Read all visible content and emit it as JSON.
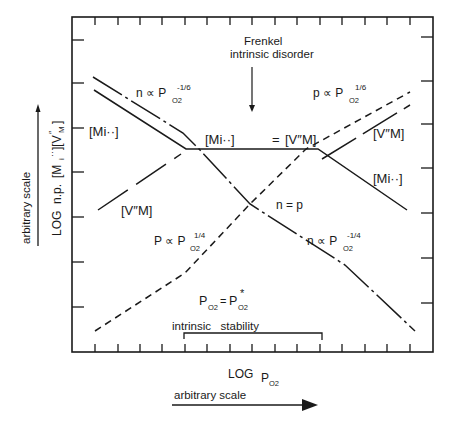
{
  "figure": {
    "type": "defect-concentration-diagram",
    "title_annotation": {
      "line1": "Frenkel",
      "line2": "intrinsic disorder"
    },
    "y_axis": {
      "label_main": "LOG",
      "label_species": "n, p, [Mi··] [V″M]",
      "label_n": "n.p.",
      "scale_label": "arbitrary scale"
    },
    "x_axis": {
      "label_main": "LOG",
      "label_var": "P",
      "label_sub": "O2",
      "scale_label": "arbitrary scale"
    },
    "labels": {
      "n_minus_sixth": {
        "lhs": "n ∝ P",
        "sub": "O2",
        "sup": "-1/6"
      },
      "p_plus_sixth": {
        "lhs": "p ∝ P",
        "sub": "O2",
        "sup": "1/6"
      },
      "p_plus_quarter": {
        "lhs": "P ∝ P",
        "sub": "O2",
        "sup": "1/4"
      },
      "n_minus_quarter": {
        "lhs": "n ∝ P",
        "sub": "O2",
        "sup": "-1/4"
      },
      "equality": {
        "left": "[Mi··]",
        "eq": "=",
        "right": "[V″M]"
      },
      "n_eq_p": "n = p",
      "mi_left": "[Mi··]",
      "vm_left": "[V″M]",
      "vm_right": "[V″M]",
      "mi_right": "[Mi··]",
      "po2_star": {
        "lhs": "P",
        "sub": "O2",
        "eq": "=",
        "rhs": "P",
        "rhs_sub": "O2",
        "rhs_sup": "*"
      },
      "stability": "intrinsic   stability"
    },
    "colors": {
      "ink": "#1a1a1a",
      "background": "#ffffff"
    }
  }
}
